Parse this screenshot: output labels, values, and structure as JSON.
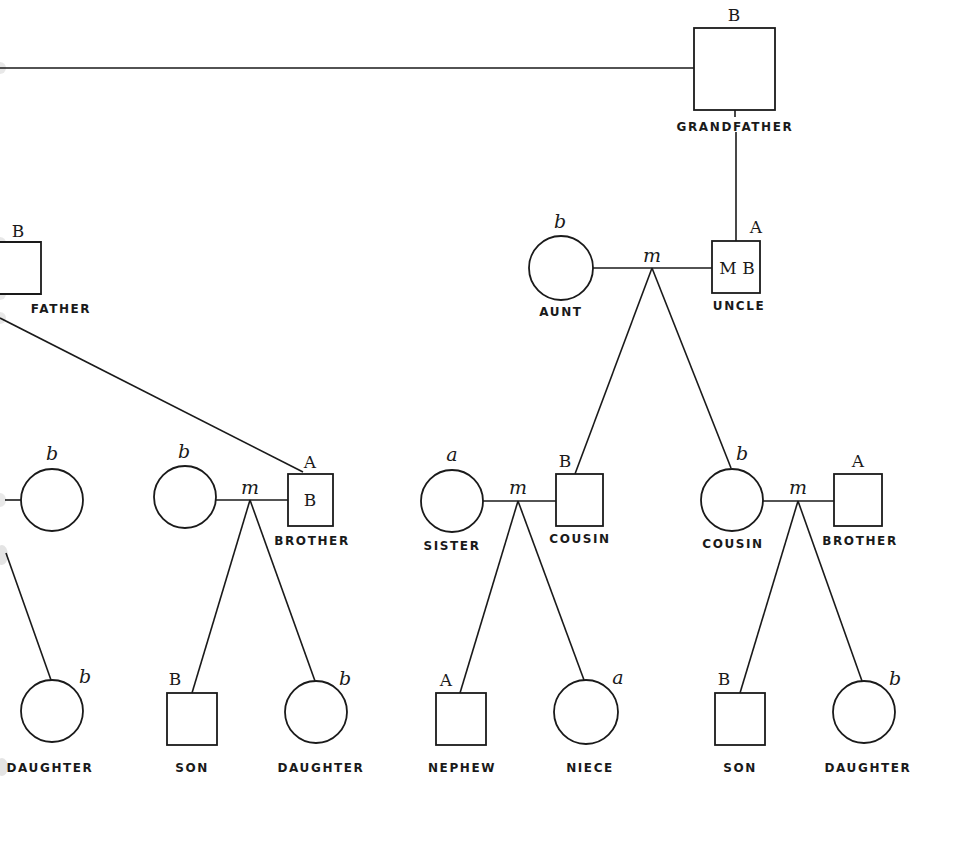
{
  "diagram": {
    "type": "pedigree-chart",
    "colors": {
      "line": "#1a1a1a",
      "background": "#ffffff"
    },
    "marriage_symbol": "m",
    "people": [
      {
        "id": "grandfather",
        "shape": "square",
        "label": "GRANDFATHER",
        "gene_outer": "B",
        "gene_inner": ""
      },
      {
        "id": "father",
        "shape": "square",
        "label": "FATHER",
        "gene_outer": "B",
        "gene_inner": ""
      },
      {
        "id": "aunt",
        "shape": "circle",
        "label": "AUNT",
        "gene_outer": "b"
      },
      {
        "id": "uncle",
        "shape": "square",
        "label": "UNCLE",
        "gene_outer": "A",
        "gene_inner": "M B"
      },
      {
        "id": "mother-left",
        "shape": "circle",
        "label": "",
        "gene_outer": "b"
      },
      {
        "id": "sister-in-law",
        "shape": "circle",
        "label": "",
        "gene_outer": "b"
      },
      {
        "id": "brother-1",
        "shape": "square",
        "label": "BROTHER",
        "gene_outer": "A",
        "gene_inner": "B"
      },
      {
        "id": "sister",
        "shape": "circle",
        "label": "SISTER",
        "gene_outer": "a"
      },
      {
        "id": "cousin-male",
        "shape": "square",
        "label": "COUSIN",
        "gene_outer": "B",
        "gene_inner": ""
      },
      {
        "id": "cousin-female",
        "shape": "circle",
        "label": "COUSIN",
        "gene_outer": "b"
      },
      {
        "id": "brother-2",
        "shape": "square",
        "label": "BROTHER",
        "gene_outer": "A",
        "gene_inner": ""
      },
      {
        "id": "daughter-1",
        "shape": "circle",
        "label": "DAUGHTER",
        "gene_outer": "b"
      },
      {
        "id": "son-1",
        "shape": "square",
        "label": "SON",
        "gene_outer": "B"
      },
      {
        "id": "daughter-2",
        "shape": "circle",
        "label": "DAUGHTER",
        "gene_outer": "b"
      },
      {
        "id": "nephew",
        "shape": "square",
        "label": "NEPHEW",
        "gene_outer": "A"
      },
      {
        "id": "niece",
        "shape": "circle",
        "label": "NIECE",
        "gene_outer": "a"
      },
      {
        "id": "son-2",
        "shape": "square",
        "label": "SON",
        "gene_outer": "B"
      },
      {
        "id": "daughter-3",
        "shape": "circle",
        "label": "DAUGHTER",
        "gene_outer": "b"
      }
    ],
    "labels": {
      "grandfather": "GRANDFATHER",
      "father": "FATHER",
      "aunt": "AUNT",
      "uncle": "UNCLE",
      "brother_1": "BROTHER",
      "sister": "SISTER",
      "cousin_male": "COUSIN",
      "cousin_female": "COUSIN",
      "brother_2": "BROTHER",
      "daughter_1": "DAUGHTER",
      "son_1": "SON",
      "daughter_2": "DAUGHTER",
      "nephew": "NEPHEW",
      "niece": "NIECE",
      "son_2": "SON",
      "daughter_3": "DAUGHTER"
    },
    "genes": {
      "grandfather": "B",
      "father": "B",
      "aunt": "b",
      "uncle_outer": "A",
      "uncle_inner": "M B",
      "mother_left": "b",
      "sister_in_law": "b",
      "brother_1_outer": "A",
      "brother_1_inner": "B",
      "sister": "a",
      "cousin_male": "B",
      "cousin_female": "b",
      "brother_2": "A",
      "daughter_1": "b",
      "son_1": "B",
      "daughter_2": "b",
      "nephew": "A",
      "niece": "a",
      "son_2": "B",
      "daughter_3": "b"
    },
    "marriages": [
      {
        "partners": [
          "aunt",
          "uncle"
        ],
        "children": [
          "cousin-male",
          "cousin-female"
        ]
      },
      {
        "partners": [
          "sister-in-law",
          "brother-1"
        ],
        "children": [
          "son-1",
          "daughter-2"
        ]
      },
      {
        "partners": [
          "sister",
          "cousin-male"
        ],
        "children": [
          "nephew",
          "niece"
        ]
      },
      {
        "partners": [
          "cousin-female",
          "brother-2"
        ],
        "children": [
          "son-2",
          "daughter-3"
        ]
      }
    ]
  }
}
